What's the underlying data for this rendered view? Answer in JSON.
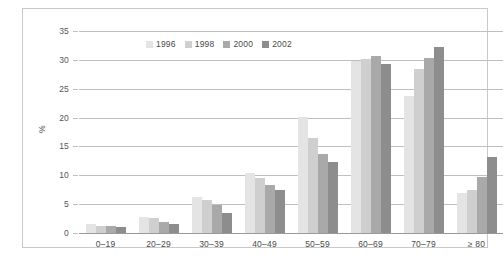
{
  "figure": {
    "caption_clipped": ""
  },
  "legend": {
    "position": "top-center-inside",
    "items": [
      {
        "label": "1996",
        "color": "#e4e4e4"
      },
      {
        "label": "1998",
        "color": "#cfcfcf"
      },
      {
        "label": "2000",
        "color": "#a9a9a9"
      },
      {
        "label": "2002",
        "color": "#8d8d8d"
      }
    ]
  },
  "axes": {
    "ylabel": "%",
    "yticks": [
      "0",
      "5",
      "10",
      "15",
      "20",
      "25",
      "30",
      "35"
    ],
    "xlabel": ""
  },
  "chart_data": {
    "type": "bar",
    "title": "",
    "subtitle": "",
    "xlabel": "",
    "ylabel": "%",
    "ylim": [
      0,
      35
    ],
    "yticks": [
      0,
      5,
      10,
      15,
      20,
      25,
      30,
      35
    ],
    "grid": true,
    "legend_position": "top-center",
    "categories": [
      "0–19",
      "20–29",
      "30–39",
      "40–49",
      "50–59",
      "60–69",
      "70–79",
      "≥ 80"
    ],
    "series": [
      {
        "name": "1996",
        "color": "#e4e4e4",
        "values": [
          1.5,
          2.8,
          6.2,
          10.4,
          20.1,
          29.8,
          23.8,
          7.0
        ]
      },
      {
        "name": "1998",
        "color": "#cfcfcf",
        "values": [
          1.3,
          2.6,
          5.7,
          9.6,
          16.4,
          30.2,
          28.5,
          7.4
        ]
      },
      {
        "name": "2000",
        "color": "#a9a9a9",
        "values": [
          1.2,
          1.9,
          4.8,
          8.3,
          13.7,
          30.6,
          30.4,
          9.7
        ]
      },
      {
        "name": "2002",
        "color": "#8d8d8d",
        "values": [
          1.1,
          1.5,
          3.5,
          7.4,
          12.3,
          29.3,
          32.3,
          13.2
        ]
      }
    ]
  }
}
